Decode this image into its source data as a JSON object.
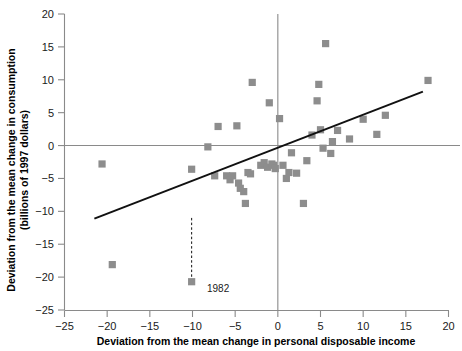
{
  "chart_data": {
    "type": "scatter",
    "title": "",
    "xlabel": "Deviation from the mean change in personal disposable income",
    "ylabel": "Deviation from the mean change in consumption\n(billions of 1997 dollars)",
    "ylabel_line1": "Deviation from the mean change in consumption",
    "ylabel_line2": "(billions of 1997 dollars)",
    "xlim": [
      -25,
      20
    ],
    "ylim": [
      -25,
      20
    ],
    "xticks": [
      -25,
      -20,
      -15,
      -10,
      -5,
      0,
      5,
      10,
      15,
      20
    ],
    "yticks": [
      -25,
      -20,
      -15,
      -10,
      -5,
      0,
      5,
      10,
      15,
      20
    ],
    "xtick_labels": [
      "−25",
      "−20",
      "−15",
      "−10",
      "−5",
      "0",
      "5",
      "10",
      "15",
      "20"
    ],
    "ytick_labels": [
      "−25",
      "−20",
      "−15",
      "−10",
      "−5",
      "0",
      "5",
      "10",
      "15",
      "20"
    ],
    "grid": false,
    "legend": null,
    "marker_color": "#8d8d8d",
    "marker_shape": "square",
    "axis_color": "#8a8a8a",
    "line_color": "#111111",
    "zero_lines": {
      "x": 0,
      "y": 0
    },
    "points": [
      [
        -20.6,
        -2.8
      ],
      [
        -19.4,
        -18.1
      ],
      [
        -10.1,
        -3.6
      ],
      [
        -10.1,
        -20.7
      ],
      [
        -8.2,
        -0.2
      ],
      [
        -7.4,
        -4.6
      ],
      [
        -7.0,
        2.9
      ],
      [
        -6.0,
        -4.6
      ],
      [
        -5.6,
        -5.2
      ],
      [
        -5.3,
        -4.6
      ],
      [
        -4.8,
        3.0
      ],
      [
        -4.6,
        -5.7
      ],
      [
        -4.4,
        -6.5
      ],
      [
        -4.0,
        -7.0
      ],
      [
        -3.8,
        -8.8
      ],
      [
        -3.5,
        -4.1
      ],
      [
        -3.2,
        -4.3
      ],
      [
        -3.0,
        9.6
      ],
      [
        -2.0,
        -3.0
      ],
      [
        -1.6,
        -2.6
      ],
      [
        -1.2,
        -3.3
      ],
      [
        -1.0,
        6.5
      ],
      [
        -0.7,
        -2.8
      ],
      [
        -0.5,
        -3.0
      ],
      [
        -0.3,
        -3.5
      ],
      [
        0.2,
        4.1
      ],
      [
        0.6,
        -3.0
      ],
      [
        1.0,
        -5.0
      ],
      [
        1.3,
        -4.1
      ],
      [
        1.6,
        -1.1
      ],
      [
        2.2,
        -4.2
      ],
      [
        3.0,
        -8.8
      ],
      [
        3.4,
        -2.3
      ],
      [
        4.0,
        1.6
      ],
      [
        4.6,
        6.8
      ],
      [
        4.8,
        9.3
      ],
      [
        5.0,
        2.4
      ],
      [
        5.3,
        -0.4
      ],
      [
        5.6,
        15.5
      ],
      [
        6.2,
        -1.2
      ],
      [
        6.4,
        0.6
      ],
      [
        7.0,
        2.3
      ],
      [
        8.4,
        1.0
      ],
      [
        10.0,
        4.0
      ],
      [
        11.6,
        1.7
      ],
      [
        12.6,
        4.6
      ],
      [
        17.6,
        9.9
      ]
    ],
    "regression_line": {
      "x0": -21.5,
      "y0": -11.1,
      "x1": 17.0,
      "y1": 8.2
    },
    "annotations": [
      {
        "text": "1982",
        "point": [
          -10.1,
          -20.7
        ],
        "leader_from": [
          -10.1,
          -11.0
        ],
        "leader_to": [
          -10.1,
          -20.0
        ],
        "label_x": -8.3,
        "label_y": -21.6
      }
    ]
  }
}
